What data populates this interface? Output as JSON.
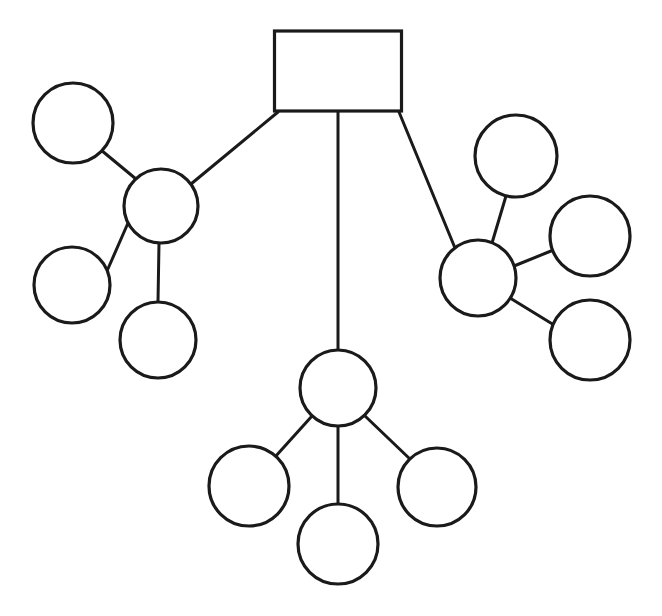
{
  "diagram": {
    "type": "node-link-tree",
    "canvas": {
      "width": 662,
      "height": 616,
      "background": "#ffffff"
    },
    "style": {
      "stroke_color": "#1a1a1a",
      "node_fill": "#ffffff",
      "node_stroke_width": 3.2,
      "edge_stroke_width": 3.0
    },
    "nodes": [
      {
        "id": "root",
        "shape": "rect",
        "label": "",
        "x": 338,
        "y": 71,
        "w": 127,
        "h": 80,
        "rx": 0,
        "role": "root"
      },
      {
        "id": "hubL",
        "shape": "circle",
        "label": "",
        "x": 161,
        "y": 206,
        "r": 37,
        "role": "hub"
      },
      {
        "id": "L1",
        "shape": "circle",
        "label": "",
        "x": 73,
        "y": 123,
        "r": 40,
        "role": "leaf"
      },
      {
        "id": "L2",
        "shape": "circle",
        "label": "",
        "x": 72,
        "y": 285,
        "r": 38,
        "role": "leaf"
      },
      {
        "id": "L3",
        "shape": "circle",
        "label": "",
        "x": 158,
        "y": 340,
        "r": 38,
        "role": "leaf"
      },
      {
        "id": "hubB",
        "shape": "circle",
        "label": "",
        "x": 338,
        "y": 388,
        "r": 38,
        "role": "hub"
      },
      {
        "id": "B1",
        "shape": "circle",
        "label": "",
        "x": 249,
        "y": 486,
        "r": 40,
        "role": "leaf"
      },
      {
        "id": "B2",
        "shape": "circle",
        "label": "",
        "x": 338,
        "y": 544,
        "r": 40,
        "role": "leaf"
      },
      {
        "id": "B3",
        "shape": "circle",
        "label": "",
        "x": 437,
        "y": 487,
        "r": 39,
        "role": "leaf"
      },
      {
        "id": "hubR",
        "shape": "circle",
        "label": "",
        "x": 478,
        "y": 278,
        "r": 38,
        "role": "hub"
      },
      {
        "id": "R1",
        "shape": "circle",
        "label": "",
        "x": 516,
        "y": 156,
        "r": 41,
        "role": "leaf"
      },
      {
        "id": "R2",
        "shape": "circle",
        "label": "",
        "x": 590,
        "y": 236,
        "r": 40,
        "role": "leaf"
      },
      {
        "id": "R3",
        "shape": "circle",
        "label": "",
        "x": 590,
        "y": 340,
        "r": 40,
        "role": "leaf"
      }
    ],
    "edges": [
      {
        "id": "e-root-hubL",
        "from": "root",
        "to": "hubL",
        "x1": 278,
        "y1": 112,
        "x2": 191,
        "y2": 184
      },
      {
        "id": "e-root-hubB",
        "from": "root",
        "to": "hubB",
        "x1": 338,
        "y1": 112,
        "x2": 338,
        "y2": 350
      },
      {
        "id": "e-root-hubR",
        "from": "root",
        "to": "hubR",
        "x1": 399,
        "y1": 112,
        "x2": 455,
        "y2": 248
      },
      {
        "id": "e-hubL-L1",
        "from": "hubL",
        "to": "L1",
        "x1": 136,
        "y1": 179,
        "x2": 101,
        "y2": 150
      },
      {
        "id": "e-hubL-L2",
        "from": "hubL",
        "to": "L2",
        "x1": 128,
        "y1": 223,
        "x2": 107,
        "y2": 271
      },
      {
        "id": "e-hubL-L3",
        "from": "hubL",
        "to": "L3",
        "x1": 159,
        "y1": 243,
        "x2": 158,
        "y2": 302
      },
      {
        "id": "e-hubB-B1",
        "from": "hubB",
        "to": "B1",
        "x1": 312,
        "y1": 416,
        "x2": 275,
        "y2": 457
      },
      {
        "id": "e-hubB-B2",
        "from": "hubB",
        "to": "B2",
        "x1": 338,
        "y1": 426,
        "x2": 338,
        "y2": 504
      },
      {
        "id": "e-hubB-B3",
        "from": "hubB",
        "to": "B3",
        "x1": 365,
        "y1": 416,
        "x2": 411,
        "y2": 460
      },
      {
        "id": "e-hubR-R1",
        "from": "hubR",
        "to": "R1",
        "x1": 492,
        "y1": 243,
        "x2": 506,
        "y2": 196
      },
      {
        "id": "e-hubR-R2",
        "from": "hubR",
        "to": "R2",
        "x1": 514,
        "y1": 266,
        "x2": 551,
        "y2": 251
      },
      {
        "id": "e-hubR-R3",
        "from": "hubR",
        "to": "R3",
        "x1": 510,
        "y1": 298,
        "x2": 554,
        "y2": 325
      }
    ]
  }
}
